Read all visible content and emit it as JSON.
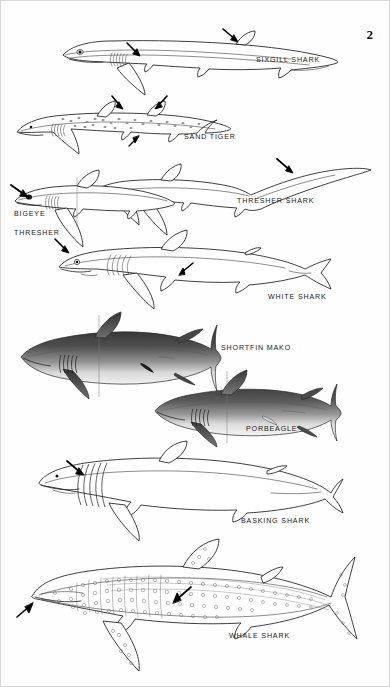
{
  "plate": {
    "page_number": "2",
    "background_color": "#ffffff",
    "ink_color": "#1c1c1c",
    "figure_count": 9
  },
  "captions": [
    {
      "id": "sixgill",
      "label": "SIXGILL SHARK",
      "x": 255,
      "y": 55
    },
    {
      "id": "sandtiger",
      "label": "SAND TIGER",
      "x": 183,
      "y": 132
    },
    {
      "id": "thresher",
      "label": "THRESHER SHARK",
      "x": 236,
      "y": 196
    },
    {
      "id": "bigeye",
      "label": "BIGEYE",
      "x": 13,
      "y": 209
    },
    {
      "id": "bigeye2",
      "label": "THRESHER",
      "x": 13,
      "y": 228
    },
    {
      "id": "white",
      "label": "WHITE SHARK",
      "x": 267,
      "y": 292
    },
    {
      "id": "mako",
      "label": "SHORTFIN MAKO",
      "x": 220,
      "y": 343
    },
    {
      "id": "porbeagle",
      "label": "PORBEAGLE",
      "x": 245,
      "y": 424
    },
    {
      "id": "basking",
      "label": "BASKING SHARK",
      "x": 240,
      "y": 516
    },
    {
      "id": "whale",
      "label": "WHALE SHARK",
      "x": 228,
      "y": 631
    }
  ],
  "figures": [
    {
      "id": "sixgill",
      "name": "sixgill-shark-illustration",
      "style": "outline",
      "arrows": 3
    },
    {
      "id": "sandtiger",
      "name": "sand-tiger-illustration",
      "style": "spotted",
      "arrows": 3
    },
    {
      "id": "bigeye",
      "name": "bigeye-thresher-illustration",
      "style": "outline",
      "arrows": 1
    },
    {
      "id": "thresher",
      "name": "thresher-shark-illustration",
      "style": "outline",
      "arrows": 2
    },
    {
      "id": "white",
      "name": "white-shark-illustration",
      "style": "outline",
      "arrows": 2
    },
    {
      "id": "mako",
      "name": "shortfin-mako-illustration",
      "style": "shaded",
      "arrows": 0
    },
    {
      "id": "porbeagle",
      "name": "porbeagle-illustration",
      "style": "shaded",
      "arrows": 0
    },
    {
      "id": "basking",
      "name": "basking-shark-illustration",
      "style": "outline",
      "arrows": 1
    },
    {
      "id": "whale",
      "name": "whale-shark-illustration",
      "style": "spotted",
      "arrows": 2
    }
  ]
}
